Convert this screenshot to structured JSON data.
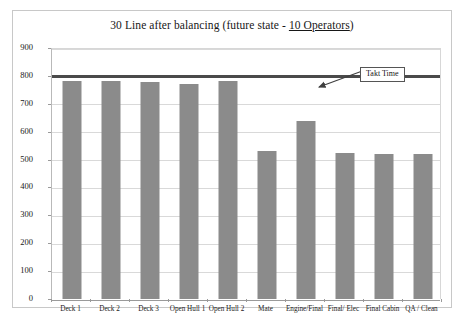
{
  "chart_data": {
    "type": "bar",
    "title": "30 Line after balancing (future state - 10 Operators)",
    "title_plain": "30 Line after balancing (future state - ",
    "title_underlined": "10 Operators",
    "title_tail": ")",
    "xlabel": "",
    "ylabel": "",
    "categories": [
      "Deck 1",
      "Deck 2",
      "Deck 3",
      "Open Hull 1",
      "Open Hull 2",
      "Mate",
      "Engine/Final",
      "Final/ Elec",
      "Final Cabin",
      "QA / Clean"
    ],
    "values": [
      782,
      782,
      778,
      772,
      782,
      530,
      640,
      524,
      520,
      520
    ],
    "ylim": [
      0,
      900
    ],
    "ytick_values": [
      0,
      100,
      200,
      300,
      400,
      500,
      600,
      700,
      800,
      900
    ],
    "ytick_labels": [
      "0",
      "100",
      "200",
      "300",
      "400",
      "500",
      "600",
      "700",
      "800",
      "900"
    ],
    "grid": true,
    "legend": false,
    "bar_color": "#8b8b8b",
    "gridline_color": "#d9d9d9",
    "axis_color": "#9a9a9a",
    "reference_lines": [
      {
        "name": "takt-time",
        "label": "Takt Time",
        "value": 800,
        "color": "#4a4a4a"
      }
    ],
    "annotations": [
      {
        "name": "takt-time-callout",
        "text": "Takt Time"
      }
    ]
  }
}
